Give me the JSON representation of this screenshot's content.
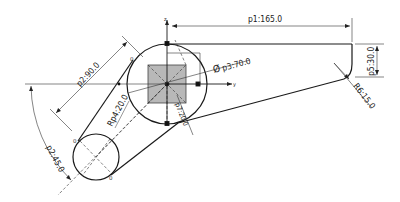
{
  "drawing": {
    "axes": {
      "z_label": "z",
      "y_label": "y"
    },
    "dimensions": {
      "p1": "p1:165.0",
      "p2_length": "p2:90.0",
      "p2_angle": "p2:45.0",
      "p3": "p3:70.0",
      "p3_symbol": "Ø",
      "p4": "Rp4:20.0",
      "p5": "p5:30.0",
      "p6": "R6:15.0",
      "p7": "p7:20.0"
    },
    "point_markers": {
      "a": "0",
      "b": "0",
      "c": "0"
    },
    "colors": {
      "line": "#1a1a1a",
      "thin": "#333333",
      "square_fill": "#b8b8b8",
      "background": "#ffffff"
    }
  }
}
